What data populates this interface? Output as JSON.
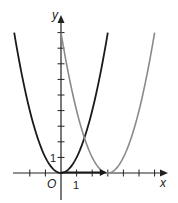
{
  "chart_data": {
    "type": "line",
    "title": "",
    "xlabel": "x",
    "ylabel": "y",
    "origin_label": "O",
    "x_tick_label": "1",
    "y_tick_label": "1",
    "xlim": [
      -3,
      7
    ],
    "ylim": [
      -2,
      10
    ],
    "grid": false,
    "series": [
      {
        "name": "y = x^2",
        "color": "#1a1a1a",
        "vertex": [
          0,
          0
        ],
        "x": [
          -3,
          -2,
          -1,
          0,
          1,
          2,
          3
        ],
        "y": [
          9,
          4,
          1,
          0,
          1,
          4,
          9
        ]
      },
      {
        "name": "y = (x-3)^2",
        "color": "#8a8a8a",
        "vertex": [
          3,
          0
        ],
        "x": [
          0,
          1,
          2,
          3,
          4,
          5,
          6
        ],
        "y": [
          9,
          4,
          1,
          0,
          1,
          4,
          9
        ]
      }
    ],
    "annotations": [
      {
        "type": "arrow",
        "from": [
          0,
          0
        ],
        "to": [
          3,
          0
        ],
        "color": "#1a1a1a",
        "meaning": "translation vector"
      }
    ]
  },
  "labels": {
    "x_axis": "x",
    "y_axis": "y",
    "origin": "O",
    "x_one": "1",
    "y_one": "1"
  }
}
